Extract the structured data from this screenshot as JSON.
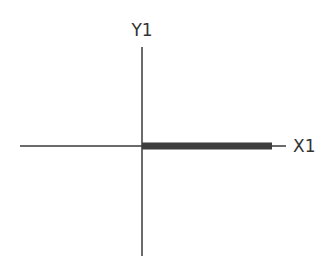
{
  "diagram": {
    "y_axis": {
      "label": "Y1",
      "x": 142,
      "y_start": 47,
      "y_end": 256,
      "color": "#3a3a3a",
      "width": 1.5
    },
    "x_axis": {
      "label": "X1",
      "y": 146,
      "x_start": 20,
      "x_end": 286,
      "color": "#3a3a3a",
      "width": 1.5
    },
    "vector": {
      "x_start": 142,
      "x_end": 272,
      "y": 146,
      "thickness": 7,
      "color": "#3d3d3d"
    }
  }
}
